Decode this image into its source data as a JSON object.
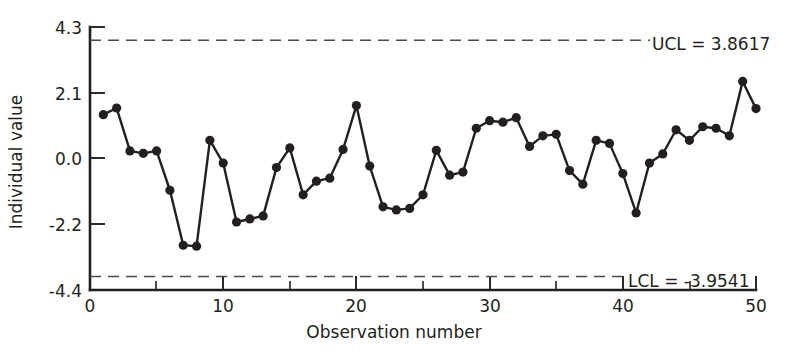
{
  "chart_data": {
    "type": "line",
    "title": "",
    "subtitle": "",
    "xlabel": "Observation number",
    "ylabel": "Individual value",
    "xlim": [
      0,
      50
    ],
    "ylim": [
      -4.4,
      4.3
    ],
    "grid": false,
    "legend": "none",
    "x_ticks": [
      0,
      10,
      20,
      30,
      40,
      50
    ],
    "x_tick_labels": [
      "0",
      "10",
      "20",
      "30",
      "40",
      "50"
    ],
    "x_minor_ticks": [
      5,
      15,
      25,
      35,
      45
    ],
    "y_ticks": [
      4.3,
      2.1,
      0.0,
      -2.2,
      -4.4
    ],
    "y_tick_labels": [
      "4.3",
      "2.1",
      "0.0",
      "-2.2",
      "-4.4"
    ],
    "series": [
      {
        "name": "Individual value",
        "marker": "filled-circle",
        "x": [
          1,
          2,
          3,
          4,
          5,
          6,
          7,
          8,
          9,
          10,
          11,
          12,
          13,
          14,
          15,
          16,
          17,
          18,
          19,
          20,
          21,
          22,
          23,
          24,
          25,
          26,
          27,
          28,
          29,
          30,
          31,
          32,
          33,
          34,
          35,
          36,
          37,
          38,
          39,
          40,
          41,
          42,
          43,
          44,
          45,
          46,
          47,
          48,
          49,
          50
        ],
        "values": [
          1.4,
          1.62,
          0.2,
          0.12,
          0.2,
          -1.1,
          -2.92,
          -2.95,
          0.55,
          -0.2,
          -2.15,
          -2.05,
          -1.95,
          -0.35,
          0.3,
          -1.25,
          -0.8,
          -0.7,
          0.25,
          1.7,
          -0.3,
          -1.65,
          -1.75,
          -1.7,
          -1.25,
          0.22,
          -0.6,
          -0.5,
          0.95,
          1.2,
          1.15,
          1.3,
          0.35,
          0.7,
          0.75,
          -0.45,
          -0.9,
          0.55,
          0.45,
          -0.55,
          -1.85,
          -0.2,
          0.1,
          0.9,
          0.55,
          1.0,
          0.95,
          0.7,
          2.5,
          1.6
        ]
      }
    ],
    "control_limits": [
      {
        "id": "ucl",
        "label": "UCL = 3.8617",
        "name": "UCL",
        "value": 3.8617,
        "style": "dashed"
      },
      {
        "id": "lcl",
        "label": "LCL = -3.9541",
        "name": "LCL",
        "value": -3.9541,
        "style": "dashed"
      }
    ]
  }
}
